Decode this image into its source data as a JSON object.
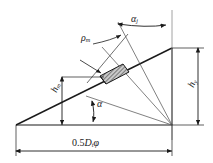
{
  "diagram": {
    "colors": {
      "line": "#1a1a1a",
      "background": "#ffffff",
      "hatch": "#333333",
      "block_fill": "#bdbdbd"
    },
    "labels": {
      "angle_incline": "α",
      "angle_j": "α",
      "angle_j_sub": "j",
      "radius": "ρ",
      "radius_sub": "m",
      "height_m": "h",
      "height_m_sub": "m",
      "height_y": "h",
      "height_y_sub": "y",
      "base_prefix": "0.5",
      "base_var": "D",
      "base_sub": "t",
      "base_suffix": "φ"
    },
    "elements": [
      {
        "name": "incline-hypotenuse",
        "type": "line"
      },
      {
        "name": "base-line",
        "type": "line"
      },
      {
        "name": "vertical-right-edge",
        "type": "line"
      },
      {
        "name": "hatched-block",
        "type": "parallelogram"
      },
      {
        "name": "normal-ray",
        "type": "line"
      },
      {
        "name": "radius-ray",
        "type": "line"
      },
      {
        "name": "angle-arc-j",
        "type": "arc"
      },
      {
        "name": "angle-arc-alpha",
        "type": "arc"
      },
      {
        "name": "dimension-h-m",
        "type": "dimension"
      },
      {
        "name": "dimension-h-y",
        "type": "dimension"
      },
      {
        "name": "dimension-base",
        "type": "dimension"
      }
    ]
  }
}
